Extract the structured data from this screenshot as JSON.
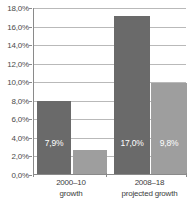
{
  "chart_data": {
    "type": "bar",
    "title": "",
    "subtitle": "",
    "xlabel": "",
    "ylabel": "",
    "ylim": [
      0,
      18
    ],
    "ytick_labels": [
      "18,0%",
      "16,0%",
      "14,0%",
      "12,0%",
      "10,0%",
      "8,0%",
      "6,0%",
      "4,0%",
      "2,0%",
      "0,0%"
    ],
    "ytick_values": [
      18,
      16,
      14,
      12,
      10,
      8,
      6,
      4,
      2,
      0
    ],
    "grid": "horizontal",
    "legend": "none",
    "categories": [
      "2000–10 growth",
      "2008–18 projected growth"
    ],
    "category_lines": [
      [
        "2000–10",
        "growth"
      ],
      [
        "2008–18",
        "projected growth"
      ]
    ],
    "series": [
      {
        "name": "series-1",
        "color": "#6a6a6a",
        "values": [
          7.9,
          17.0
        ],
        "value_labels": [
          "7,9%",
          "17,0%"
        ]
      },
      {
        "name": "series-2",
        "color": "#9e9e9e",
        "values": [
          2.6,
          9.8
        ],
        "value_labels": [
          "2,6%",
          "9,8%"
        ]
      }
    ],
    "bars": [
      {
        "name": "bar-2000-10-growth-series-1",
        "label": "7,9%",
        "value": 7.9,
        "series": 0,
        "category": 0,
        "color": "#6a6a6a",
        "x": 3,
        "width": 34
      },
      {
        "name": "bar-2000-10-growth-series-2",
        "label": "2,6%",
        "value": 2.6,
        "series": 1,
        "category": 0,
        "color": "#9e9e9e",
        "x": 39,
        "width": 34
      },
      {
        "name": "bar-2008-18-projected-growth-series-1",
        "label": "17,0%",
        "value": 17.0,
        "series": 0,
        "category": 1,
        "color": "#6a6a6a",
        "x": 80,
        "width": 36
      },
      {
        "name": "bar-2008-18-projected-growth-series-2",
        "label": "9,8%",
        "value": 9.8,
        "series": 1,
        "category": 1,
        "color": "#9e9e9e",
        "x": 117,
        "width": 36
      }
    ],
    "axis_colors": {
      "axis_line": "#8a8a8a",
      "gridline": "#b9b9b9",
      "tick_text": "#4a4a4a",
      "category_text": "#3d3d3d",
      "bar_label_text": "#ffffff"
    }
  }
}
